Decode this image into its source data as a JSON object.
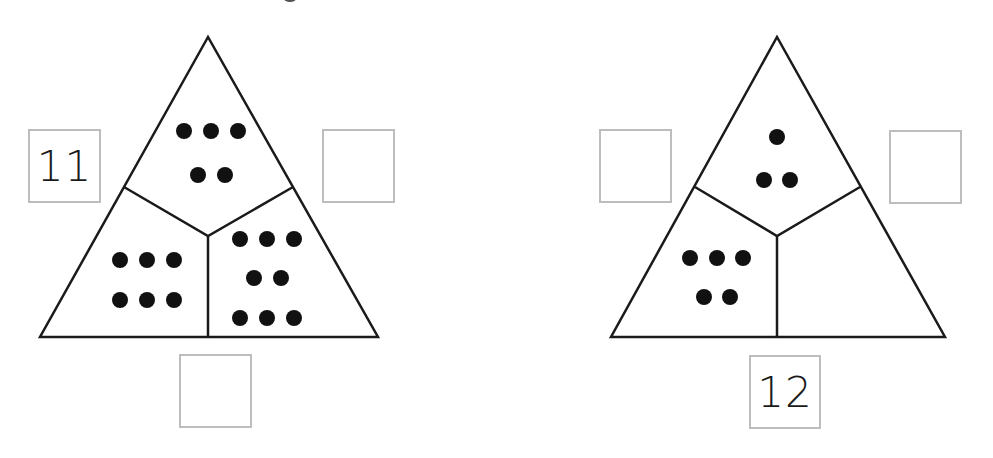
{
  "puzzles": [
    {
      "id": "left",
      "sections": {
        "top": {
          "dots": 5,
          "rows": [
            3,
            2
          ]
        },
        "bottom_left": {
          "dots": 6,
          "rows": [
            3,
            3
          ]
        },
        "bottom_right": {
          "dots": 8,
          "rows": [
            3,
            2,
            3
          ]
        }
      },
      "boxes": {
        "left": "11",
        "right": "",
        "bottom": ""
      }
    },
    {
      "id": "right",
      "sections": {
        "top": {
          "dots": 3,
          "rows": [
            1,
            2
          ]
        },
        "bottom_left": {
          "dots": 5,
          "rows": [
            3,
            2
          ]
        },
        "bottom_right": {
          "dots": 0,
          "rows": []
        }
      },
      "boxes": {
        "left": "",
        "right": "",
        "bottom": "12"
      }
    }
  ],
  "colors": {
    "line": "#1a1a1a",
    "dot": "#111111",
    "box_border": "#bdbdbd"
  }
}
